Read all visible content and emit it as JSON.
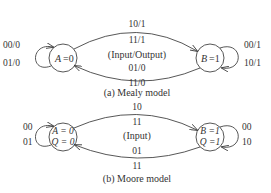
{
  "mealy": {
    "state_a": {
      "name": "A",
      "value": "=0",
      "label": "A =0"
    },
    "state_b": {
      "name": "B",
      "value": "=1",
      "label": "B =1"
    },
    "self_loop_a": [
      "00/0",
      "01/0"
    ],
    "self_loop_b": [
      "00/1",
      "10/1"
    ],
    "top_arc_labels": [
      "10/1",
      "11/1"
    ],
    "center_label": "(Input/Output)",
    "bottom_arc_labels": [
      "01/0",
      "11/0"
    ],
    "caption": "(a)  Mealy model"
  },
  "moore": {
    "state_a": {
      "line1": "A = 0",
      "line2": "Q = 0"
    },
    "state_b": {
      "line1": "B =1",
      "line2": "Q =1"
    },
    "self_loop_a": [
      "00",
      "01"
    ],
    "self_loop_b": [
      "00",
      "10"
    ],
    "top_arc_labels": [
      "10",
      "11"
    ],
    "center_label": "(Input)",
    "bottom_arc_labels": [
      "01",
      "11"
    ],
    "caption": "(b)  Moore model"
  }
}
